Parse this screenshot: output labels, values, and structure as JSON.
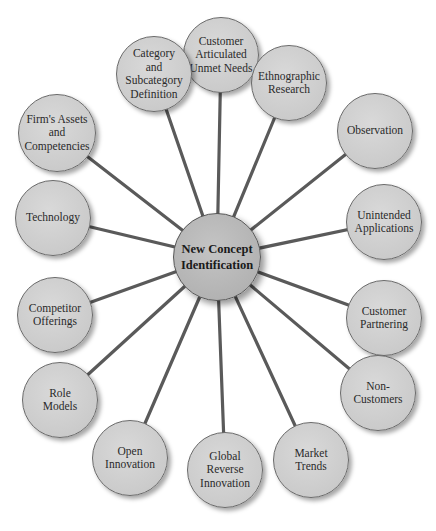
{
  "diagram": {
    "type": "hub-and-spoke",
    "center": {
      "label": "New Concept\nIdentification",
      "x": 217,
      "y": 257,
      "r": 44
    },
    "nodes": [
      {
        "id": "customer-articulated-unmet-needs",
        "label": "Customer\nArticulated\nUnmet Needs",
        "x": 221,
        "y": 55,
        "r": 38
      },
      {
        "id": "category-and-subcategory-definition",
        "label": "Category\nand\nSubcategory\nDefinition",
        "x": 154,
        "y": 74,
        "r": 38
      },
      {
        "id": "ethnographic-research",
        "label": "Ethnographic\nResearch",
        "x": 289,
        "y": 83,
        "r": 38
      },
      {
        "id": "firms-assets-and-competencies",
        "label": "Firm's Assets\nand\nCompetencies",
        "x": 57,
        "y": 133,
        "r": 39
      },
      {
        "id": "observation",
        "label": "Observation",
        "x": 375,
        "y": 131,
        "r": 38
      },
      {
        "id": "technology",
        "label": "Technology",
        "x": 53,
        "y": 218,
        "r": 38
      },
      {
        "id": "unintended-applications",
        "label": "Unintended\nApplications",
        "x": 384,
        "y": 222,
        "r": 38
      },
      {
        "id": "competitor-offerings",
        "label": "Competitor\nOfferings",
        "x": 55,
        "y": 315,
        "r": 38
      },
      {
        "id": "customer-partnering",
        "label": "Customer\nPartnering",
        "x": 384,
        "y": 318,
        "r": 38
      },
      {
        "id": "role-models",
        "label": "Role\nModels",
        "x": 60,
        "y": 400,
        "r": 38
      },
      {
        "id": "non-customers",
        "label": "Non-\nCustomers",
        "x": 378,
        "y": 393,
        "r": 38
      },
      {
        "id": "open-innovation",
        "label": "Open\nInnovation",
        "x": 130,
        "y": 458,
        "r": 38
      },
      {
        "id": "global-reverse-innovation",
        "label": "Global\nReverse\nInnovation",
        "x": 225,
        "y": 470,
        "r": 38
      },
      {
        "id": "market-trends",
        "label": "Market\nTrends",
        "x": 311,
        "y": 460,
        "r": 38
      }
    ],
    "colors": {
      "node_fill": "#cbcbcb",
      "center_fill": "#b3b3b3",
      "spoke": "#5a5a5a",
      "text": "#2a2a2a"
    }
  }
}
